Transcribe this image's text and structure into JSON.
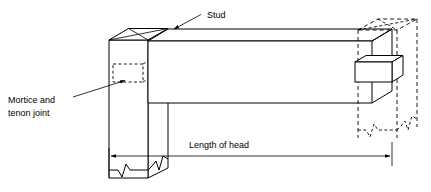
{
  "figure": {
    "type": "technical-isometric-drawing",
    "background_color": "#ffffff",
    "line_color": "#000000",
    "labels": {
      "stud": "Stud",
      "mortice_line1": "Mortice and",
      "mortice_line2": "tenon joint",
      "length_of_head": "Length of head"
    },
    "annotations": [
      {
        "name": "stud-label",
        "text": "Stud",
        "text_x": 207,
        "text_y": 15,
        "leader_from_x": 201,
        "leader_from_y": 15,
        "leader_to_x": 172,
        "leader_to_y": 30,
        "arrow": true
      },
      {
        "name": "mortice-and-tenon-joint-label",
        "text_line1": "Mortice and",
        "text_line2": "tenon joint",
        "text_x": 8,
        "text_y1": 100,
        "text_y2": 113,
        "leader_from_x": 73,
        "leader_from_y": 97,
        "leader_to_x": 127,
        "leader_to_y": 80,
        "arrow": true
      },
      {
        "name": "length-of-head-dimension",
        "text": "Length of head",
        "text_x": 219,
        "text_y": 148,
        "line_y": 156,
        "line_from_x": 109,
        "line_to_x": 392,
        "arrows": "both"
      }
    ],
    "geometry": {
      "left_post": {
        "name": "left-stud-post",
        "front_face": [
          [
            109,
            40
          ],
          [
            148,
            40
          ],
          [
            148,
            178
          ],
          [
            109,
            178
          ]
        ],
        "top_front_edge_y": 40,
        "side_face": [
          [
            148,
            40
          ],
          [
            168,
            29
          ],
          [
            168,
            168
          ],
          [
            148,
            178
          ]
        ],
        "chamfer_top": [
          [
            109,
            40
          ],
          [
            128,
            28
          ],
          [
            168,
            28
          ],
          [
            148,
            40
          ]
        ],
        "break_line_bottom": true
      },
      "mortice": {
        "name": "mortice-hidden-rectangle",
        "rect": [
          [
            113,
            64
          ],
          [
            143,
            64
          ],
          [
            143,
            82
          ],
          [
            113,
            82
          ]
        ],
        "style": "hidden"
      },
      "head_beam": {
        "name": "head-beam",
        "top_face": [
          [
            148,
            41
          ],
          [
            168,
            29
          ],
          [
            392,
            29
          ],
          [
            372,
            41
          ]
        ],
        "front_face": [
          [
            148,
            41
          ],
          [
            372,
            41
          ],
          [
            372,
            103
          ],
          [
            148,
            103
          ]
        ],
        "right_end": [
          [
            372,
            41
          ],
          [
            392,
            29
          ],
          [
            392,
            91
          ],
          [
            372,
            103
          ]
        ]
      },
      "right_post": {
        "name": "right-stud-post-hidden",
        "style": "hidden",
        "front_face": [
          [
            358,
            30
          ],
          [
            397,
            30
          ],
          [
            397,
            138
          ],
          [
            358,
            138
          ]
        ],
        "side_face": [
          [
            397,
            30
          ],
          [
            417,
            19
          ],
          [
            417,
            127
          ],
          [
            397,
            138
          ]
        ],
        "chamfer_top": [
          [
            358,
            30
          ],
          [
            378,
            19
          ],
          [
            417,
            19
          ],
          [
            397,
            30
          ]
        ],
        "break_line_bottom": true
      },
      "tenon": {
        "name": "tenon-solid-block",
        "front_face": [
          [
            355,
            62
          ],
          [
            392,
            62
          ],
          [
            392,
            82
          ],
          [
            355,
            82
          ]
        ],
        "top_face": [
          [
            355,
            62
          ],
          [
            366,
            55
          ],
          [
            403,
            55
          ],
          [
            392,
            62
          ]
        ],
        "right_face": [
          [
            392,
            62
          ],
          [
            403,
            55
          ],
          [
            403,
            75
          ],
          [
            392,
            82
          ]
        ]
      }
    }
  }
}
